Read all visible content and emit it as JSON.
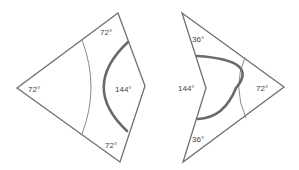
{
  "diagram": {
    "kite": {
      "name": "Kite",
      "angles": {
        "top": "72°",
        "left": "72°",
        "right": "144°",
        "bottom": "72°"
      }
    },
    "dart": {
      "name": "Dart",
      "angles": {
        "top": "36°",
        "inner": "144°",
        "right": "72°",
        "bottom": "36°"
      }
    },
    "colors": {
      "edge": "#707070",
      "arc_thin": "#8a8a8a",
      "arc_thick": "#6a6a6a",
      "label": "#444444"
    }
  }
}
